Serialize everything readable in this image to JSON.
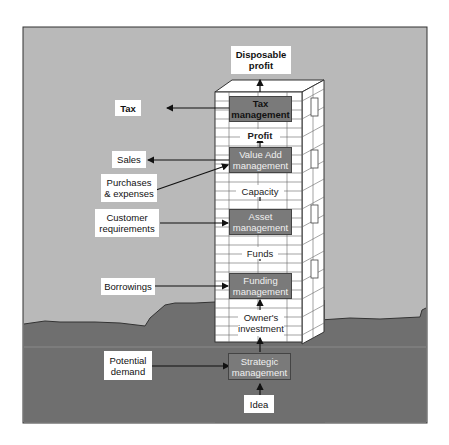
{
  "diagram": {
    "title_top": "Disposable profit",
    "colors": {
      "sky": "#b9b9b9",
      "ground": "#6f6f6f",
      "frame_border": "#333333",
      "tower_face": "#ffffff",
      "brick_line": "#555555",
      "management_box": "#7a7a7a",
      "label_bg": "#ffffff",
      "arrow": "#111111"
    },
    "tower": {
      "management_boxes": [
        {
          "id": "tax",
          "label": "Tax management"
        },
        {
          "id": "value-add",
          "label": "Value Add management"
        },
        {
          "id": "asset",
          "label": "Asset management"
        },
        {
          "id": "funding",
          "label": "Funding management"
        }
      ],
      "intermediate_flows": [
        {
          "id": "profit",
          "label": "Profit"
        },
        {
          "id": "capacity",
          "label": "Capacity"
        },
        {
          "id": "funds",
          "label": "Funds"
        },
        {
          "id": "owners-investment",
          "label": "Owner's investment"
        }
      ]
    },
    "foundation": {
      "strategic": {
        "label": "Strategic management"
      },
      "idea": {
        "label": "Idea"
      }
    },
    "side_labels": [
      {
        "id": "tax",
        "label": "Tax",
        "direction": "out"
      },
      {
        "id": "sales",
        "label": "Sales",
        "direction": "out"
      },
      {
        "id": "purchases",
        "label": "Purchases & expenses",
        "direction": "in"
      },
      {
        "id": "customer-requirements",
        "label": "Customer requirements",
        "direction": "in"
      },
      {
        "id": "borrowings",
        "label": "Borrowings",
        "direction": "in"
      },
      {
        "id": "potential-demand",
        "label": "Potential demand",
        "direction": "in"
      }
    ]
  }
}
